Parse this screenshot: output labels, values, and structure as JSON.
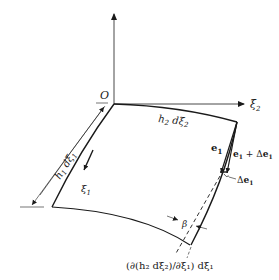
{
  "diagram": {
    "type": "curvilinear-surface-element",
    "origin_label": "O",
    "axis_xi2_label": "ξ",
    "axis_xi2_sub": "2",
    "axis_xi1_label": "ξ",
    "axis_xi1_sub": "1",
    "edge_top_label": "h",
    "edge_top_sub1": "2",
    "edge_top_mid": " dξ",
    "edge_top_sub2": "2",
    "edge_left_label": "h",
    "edge_left_sub1": "1",
    "edge_left_mid": " dξ",
    "edge_left_sub2": "1",
    "vec_e1_label": "e",
    "vec_e1_sub": "1",
    "vec_e1_delta_label": "e",
    "vec_e1_delta_sub": "1",
    "vec_e1_delta_plus": " + Δ",
    "vec_e1_delta_e": "e",
    "vec_e1_delta_sub2": "1",
    "delta_e1_prefix": "Δ",
    "delta_e1_e": "e",
    "delta_e1_sub": "1",
    "angle_label": "β",
    "bottom_formula": "(∂(h₂ dξ₂)/∂ξ₁) dξ₁",
    "colors": {
      "ink": "#1a1a1a",
      "background": "#ffffff"
    }
  }
}
